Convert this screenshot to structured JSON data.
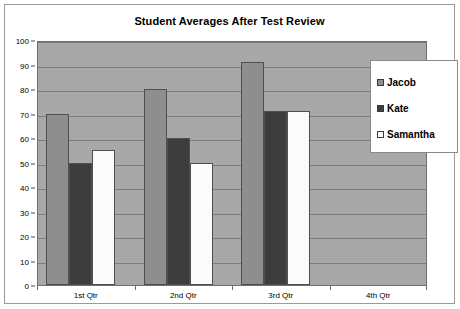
{
  "chart_data": {
    "type": "bar",
    "title": "Student Averages After Test Review",
    "xlabel": "",
    "ylabel": "",
    "ylim": [
      0,
      100
    ],
    "ytick_step": 10,
    "yticks": [
      100,
      90,
      80,
      70,
      60,
      50,
      40,
      30,
      20,
      10,
      0
    ],
    "categories": [
      "1st Qtr",
      "2nd Qtr",
      "3rd Qtr",
      "4th Qtr"
    ],
    "grid": true,
    "legend_position": "right-inside-top",
    "plot_background": "#a8a8a8",
    "series": [
      {
        "name": "Jacob",
        "color": "#8e8e8e",
        "values": [
          70,
          80,
          91,
          0
        ]
      },
      {
        "name": "Kate",
        "color": "#3d3d3d",
        "values": [
          50,
          60,
          71,
          0
        ]
      },
      {
        "name": "Samantha",
        "color": "#fbfbfb",
        "values": [
          55,
          50,
          71,
          0
        ]
      }
    ]
  }
}
